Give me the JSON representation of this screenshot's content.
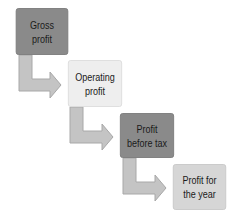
{
  "diagram": {
    "type": "flow",
    "direction": "stepped-down-right",
    "colors": {
      "dark_box": "#8a8a8a",
      "light_box": "#eeeeee",
      "mid_box": "#d6d6d6",
      "arrow_fill": "#c4c4c4",
      "arrow_stroke": "#a8a8a8",
      "text": "#1a1a1a"
    },
    "nodes": [
      {
        "id": "gross-profit",
        "label": "Gross profit",
        "style": "dark"
      },
      {
        "id": "operating-profit",
        "label": "Operating profit",
        "style": "light"
      },
      {
        "id": "profit-before-tax",
        "label": "Profit before tax",
        "style": "dark"
      },
      {
        "id": "profit-for-the-year",
        "label": "Profit for the year",
        "style": "mid"
      }
    ],
    "edges": [
      {
        "from": "gross-profit",
        "to": "operating-profit",
        "shape": "elbow-arrow"
      },
      {
        "from": "operating-profit",
        "to": "profit-before-tax",
        "shape": "elbow-arrow"
      },
      {
        "from": "profit-before-tax",
        "to": "profit-for-the-year",
        "shape": "elbow-arrow"
      }
    ]
  }
}
